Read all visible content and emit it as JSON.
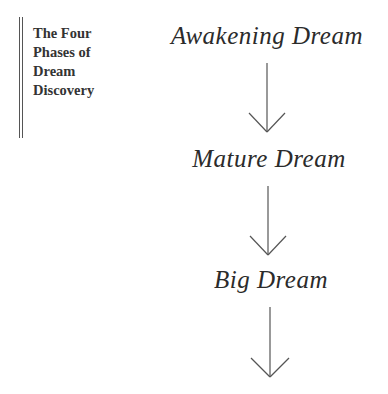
{
  "sidebar": {
    "title_lines": [
      "The Four",
      "Phases of",
      "Dream",
      "Discovery"
    ]
  },
  "phases": [
    {
      "label": "Awakening Dream"
    },
    {
      "label": "Mature Dream"
    },
    {
      "label": "Big Dream"
    }
  ],
  "colors": {
    "text": "#2b2b2b",
    "rule": "#555555",
    "arrow": "#555555",
    "background": "#ffffff"
  }
}
